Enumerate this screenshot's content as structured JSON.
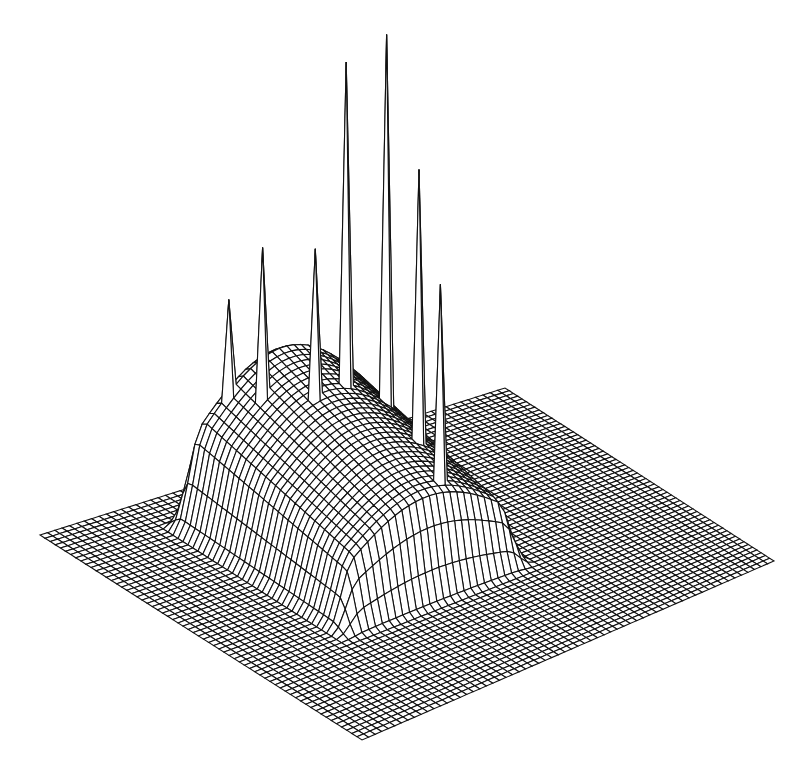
{
  "chart_data": {
    "type": "surface3d-wireframe",
    "title": "",
    "xlabel": "",
    "ylabel": "",
    "zlabel": "",
    "grid_size": [
      64,
      64
    ],
    "base_corners_px": {
      "left": [
        40,
        535
      ],
      "top": [
        505,
        388
      ],
      "right": [
        774,
        561
      ],
      "bottom": [
        362,
        740
      ]
    },
    "plateau": {
      "description": "broad raised region occupying roughly the central-left portion of the grid",
      "u_range": [
        0.22,
        0.62
      ],
      "v_range": [
        0.12,
        0.66
      ],
      "relative_height": 0.62
    },
    "spikes": [
      {
        "screen_tip": [
          224,
          300
        ],
        "relative_height": 0.45
      },
      {
        "screen_tip": [
          263,
          246
        ],
        "relative_height": 0.55
      },
      {
        "screen_tip": [
          321,
          62
        ],
        "relative_height": 0.85
      },
      {
        "screen_tip": [
          379,
          35
        ],
        "relative_height": 1.0
      },
      {
        "screen_tip": [
          438,
          170
        ],
        "relative_height": 0.72
      },
      {
        "screen_tip": [
          490,
          283
        ],
        "relative_height": 0.52
      },
      {
        "screen_tip": [
          317,
          248
        ],
        "relative_height": 0.35
      }
    ],
    "colors": {
      "line": "#111111",
      "background": "#ffffff"
    }
  }
}
